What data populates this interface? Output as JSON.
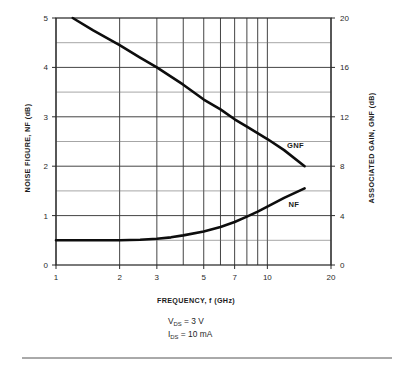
{
  "chart_data": {
    "type": "line",
    "title": "",
    "xlabel": "FREQUENCY, f (GHz)",
    "ylabel": "NOISE FIGURE, NF (dB)",
    "y2label": "ASSOCIATED GAIN, GNF (dB)",
    "xscale": "log",
    "xlim": [
      1,
      20
    ],
    "ylim": [
      0,
      5
    ],
    "y2lim": [
      0,
      20
    ],
    "grid": true,
    "legend_position": "inline-right",
    "x_tick_labels": [
      "1",
      "2",
      "3",
      "5",
      "7",
      "10",
      "20"
    ],
    "x_tick_values": [
      1,
      2,
      3,
      5,
      7,
      10,
      20
    ],
    "x_gridline_values": [
      1,
      2,
      3,
      4,
      5,
      6,
      7,
      8,
      9,
      10,
      20
    ],
    "y_tick_labels": [
      "0",
      "1",
      "2",
      "3",
      "4",
      "5"
    ],
    "y_tick_values": [
      0,
      1,
      2,
      3,
      4,
      5
    ],
    "y_minor_gridlines": [
      0.5,
      1.5,
      2.5,
      3.5,
      4.5
    ],
    "y2_tick_labels": [
      "0",
      "4",
      "8",
      "12",
      "16",
      "20"
    ],
    "y2_tick_values": [
      0,
      4,
      8,
      12,
      16,
      20
    ],
    "series": [
      {
        "name": "GNF",
        "label": "GNF",
        "axis": "right",
        "units": "dB",
        "x": [
          1.2,
          1.5,
          2,
          2.5,
          3,
          4,
          5,
          6,
          7,
          8,
          10,
          12,
          15
        ],
        "values": [
          20.0,
          19.0,
          17.8,
          16.8,
          16.0,
          14.6,
          13.4,
          12.6,
          11.8,
          11.2,
          10.2,
          9.3,
          8.0
        ],
        "label_x": 12.4,
        "label_y": 9.7
      },
      {
        "name": "NF",
        "label": "NF",
        "axis": "left",
        "units": "dB",
        "x": [
          1,
          1.5,
          2,
          2.5,
          3,
          3.5,
          4,
          5,
          6,
          7,
          8,
          9,
          10,
          12,
          15
        ],
        "values": [
          0.5,
          0.5,
          0.5,
          0.51,
          0.53,
          0.56,
          0.6,
          0.68,
          0.77,
          0.87,
          0.98,
          1.08,
          1.18,
          1.36,
          1.55
        ],
        "label_x": 12.6,
        "label_y": 1.23
      }
    ],
    "annotations": [
      {
        "name": "bias-vds",
        "symbol": "V",
        "subscript": "DS",
        "relation": "=",
        "value": "3 V"
      },
      {
        "name": "bias-ids",
        "symbol": "I",
        "subscript": "DS",
        "relation": "=",
        "value": "10 mA"
      }
    ],
    "colors": {
      "curve": "#0d0d0d",
      "frame": "#2b2b2b",
      "grid_major": "#3a3a3a",
      "grid_minor": "#6a6a6a",
      "text": "#1c1c1c",
      "background": "#ffffff"
    }
  }
}
